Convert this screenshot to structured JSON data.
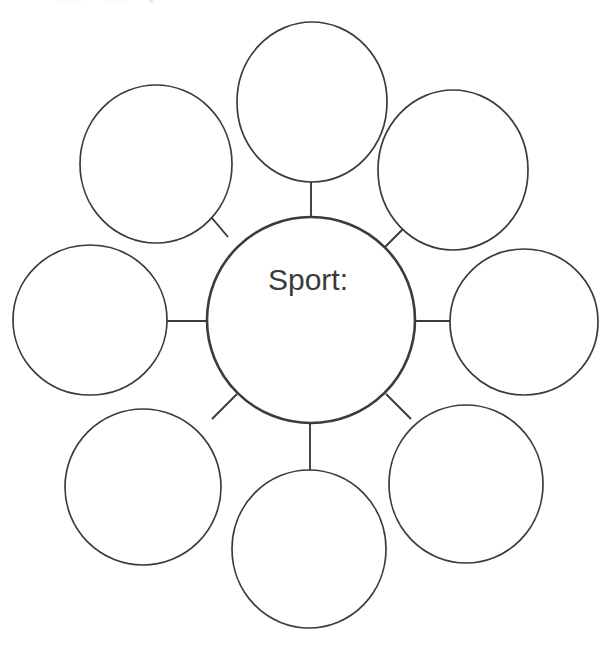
{
  "page": {
    "width": 614,
    "height": 652,
    "background_color": "#ffffff"
  },
  "style": {
    "ink_color": "#3b3b3b",
    "center_stroke_width": 2.6,
    "satellite_stroke_width": 1.7,
    "connector_stroke_width": 1.9,
    "fill_color": "#ffffff"
  },
  "center_bubble": {
    "label": "Sport:",
    "label_x": 308,
    "label_y": 290,
    "cx": 311,
    "cy": 320,
    "rx": 104,
    "ry": 103,
    "name": "center-bubble"
  },
  "satellites": [
    {
      "id": "top",
      "label": "",
      "cx": 312,
      "cy": 102,
      "rx": 75,
      "ry": 80,
      "angle_deg": 270
    },
    {
      "id": "top-right",
      "label": "",
      "cx": 453,
      "cy": 170,
      "rx": 75,
      "ry": 80,
      "angle_deg": 315
    },
    {
      "id": "right",
      "label": "",
      "cx": 524,
      "cy": 322,
      "rx": 74,
      "ry": 73,
      "angle_deg": 0
    },
    {
      "id": "bottom-right",
      "label": "",
      "cx": 466,
      "cy": 484,
      "rx": 77,
      "ry": 79,
      "angle_deg": 45
    },
    {
      "id": "bottom",
      "label": "",
      "cx": 309,
      "cy": 549,
      "rx": 77,
      "ry": 79,
      "angle_deg": 90
    },
    {
      "id": "bottom-left",
      "label": "",
      "cx": 143,
      "cy": 487,
      "rx": 78,
      "ry": 78,
      "angle_deg": 135
    },
    {
      "id": "left",
      "label": "",
      "cx": 90,
      "cy": 320,
      "rx": 77,
      "ry": 75,
      "angle_deg": 180
    },
    {
      "id": "top-left",
      "label": "",
      "cx": 156,
      "cy": 164,
      "rx": 76,
      "ry": 79,
      "angle_deg": 225
    }
  ],
  "connectors": [
    {
      "id": "connector-top",
      "x1": 311,
      "y1": 217,
      "x2": 311,
      "y2": 182
    },
    {
      "id": "connector-top-right",
      "x1": 385,
      "y1": 247,
      "x2": 410,
      "y2": 222
    },
    {
      "id": "connector-right",
      "x1": 415,
      "y1": 321,
      "x2": 450,
      "y2": 321
    },
    {
      "id": "connector-bottom-right",
      "x1": 386,
      "y1": 394,
      "x2": 411,
      "y2": 419
    },
    {
      "id": "connector-bottom",
      "x1": 310,
      "y1": 423,
      "x2": 310,
      "y2": 470
    },
    {
      "id": "connector-bottom-left",
      "x1": 237,
      "y1": 394,
      "x2": 212,
      "y2": 419
    },
    {
      "id": "connector-left",
      "x1": 207,
      "y1": 321,
      "x2": 167,
      "y2": 321
    },
    {
      "id": "connector-top-left",
      "x1": 228,
      "y1": 237,
      "x2": 206,
      "y2": 211
    }
  ]
}
